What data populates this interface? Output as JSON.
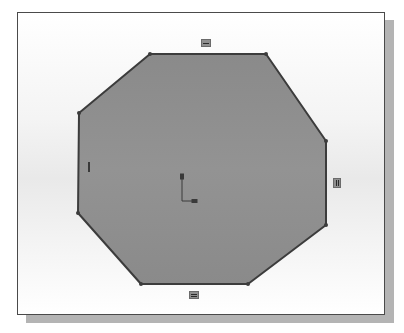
{
  "viewport": {
    "background": "#ffffff",
    "border_color": "#4a4a4a",
    "shadow_color": "#b4b4b4"
  },
  "sketch": {
    "shape": "octagon",
    "fill_color": "#8c8c8c",
    "edge_color": "#3c3c3c",
    "vertices": [
      [
        132,
        41
      ],
      [
        248,
        41
      ],
      [
        308,
        128
      ],
      [
        308,
        212
      ],
      [
        230,
        271
      ],
      [
        123,
        271
      ],
      [
        60,
        200
      ],
      [
        61,
        100
      ]
    ],
    "origin": {
      "x": 164,
      "y": 188
    }
  },
  "relations": [
    {
      "id": "top-edge",
      "type": "horizontal",
      "icon": "horizontal-relation-icon"
    },
    {
      "id": "bottom-edge",
      "type": "horizontal",
      "icon": "horizontal-relation-icon"
    },
    {
      "id": "right-edge",
      "type": "vertical",
      "icon": "vertical-relation-icon"
    },
    {
      "id": "left-edge",
      "type": "vertical",
      "icon": "vertical-relation-icon"
    }
  ]
}
